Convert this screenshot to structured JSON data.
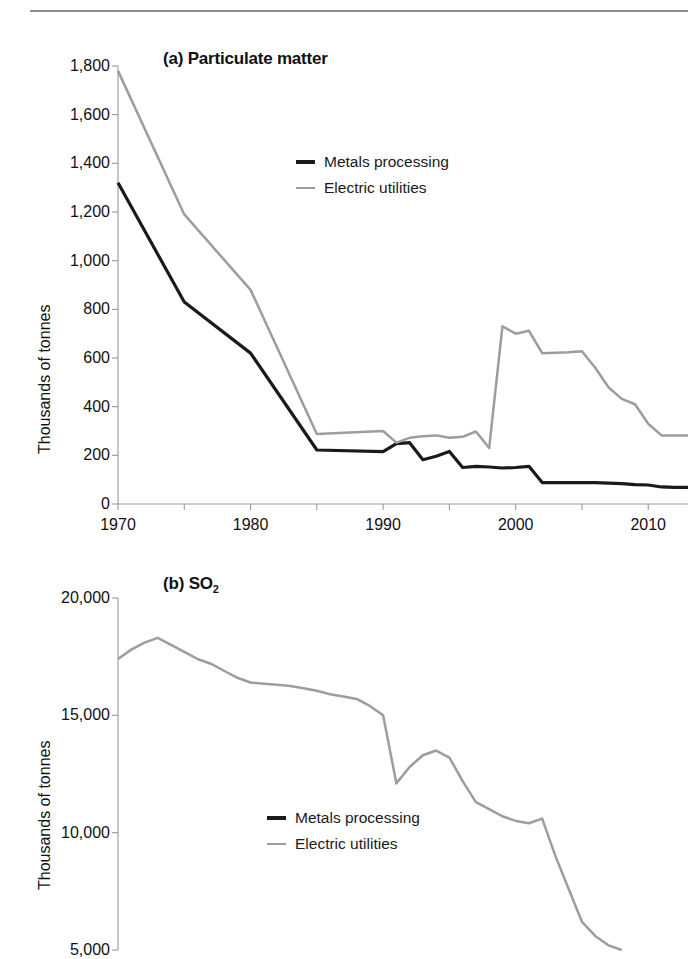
{
  "figure": {
    "ylabel": "Thousands of tonnes",
    "legend": {
      "metals_label": "Metals processing",
      "utilities_label": "Electric utilities"
    },
    "colors": {
      "metals": "#1a1a1a",
      "utilities": "#9d9d9d",
      "axis": "#9a9a9a",
      "rule": "#8c8c8c",
      "text": "#111111",
      "background": "#ffffff"
    }
  },
  "chart_data": [
    {
      "type": "line",
      "panel": "a",
      "title": "(a) Particulate matter",
      "title_prefix": "(a) ",
      "title_main": "Particulate matter",
      "xlabel": "",
      "ylabel": "Thousands of tonnes",
      "xlim": [
        1970,
        2013
      ],
      "ylim": [
        0,
        1800
      ],
      "yticks": [
        0,
        200,
        400,
        600,
        800,
        1000,
        1200,
        1400,
        1600,
        1800
      ],
      "ytick_labels": [
        "0",
        "200",
        "400",
        "600",
        "800",
        "1,000",
        "1,200",
        "1,400",
        "1,600",
        "1,800"
      ],
      "xticks": [
        1970,
        1980,
        1990,
        2000,
        2010
      ],
      "xtick_labels": [
        "1970",
        "1980",
        "1990",
        "2000",
        "2010"
      ],
      "xticks_minor": [
        1975,
        1985,
        1995,
        2005
      ],
      "grid": false,
      "legend_position": "upper-center",
      "x": [
        1970,
        1975,
        1980,
        1985,
        1990,
        1991,
        1992,
        1993,
        1994,
        1995,
        1996,
        1997,
        1998,
        1999,
        2000,
        2001,
        2002,
        2003,
        2004,
        2005,
        2006,
        2007,
        2008,
        2009,
        2010,
        2011,
        2012,
        2013
      ],
      "series": [
        {
          "name": "Metals processing",
          "color": "#1a1a1a",
          "values": [
            1320,
            830,
            620,
            222,
            215,
            248,
            252,
            182,
            196,
            216,
            150,
            155,
            152,
            148,
            150,
            155,
            88,
            88,
            88,
            88,
            88,
            86,
            84,
            80,
            78,
            70,
            68,
            68
          ]
        },
        {
          "name": "Electric utilities",
          "color": "#9d9d9d",
          "values": [
            1780,
            1190,
            880,
            288,
            300,
            252,
            272,
            278,
            282,
            272,
            276,
            298,
            230,
            730,
            700,
            712,
            620,
            622,
            624,
            628,
            560,
            480,
            432,
            410,
            330,
            282,
            282,
            282
          ]
        }
      ]
    },
    {
      "type": "line",
      "panel": "b",
      "title": "(b) SO2",
      "title_prefix": "(b) ",
      "title_main": "SO",
      "title_sub": "2",
      "xlabel": "",
      "ylabel": "Thousands of tonnes",
      "xlim": [
        1970,
        2013
      ],
      "ylim": [
        5000,
        20000
      ],
      "yticks": [
        5000,
        10000,
        15000,
        20000
      ],
      "ytick_labels": [
        "5,000",
        "10,000",
        "15,000",
        "20,000"
      ],
      "xticks": [],
      "xtick_labels": [],
      "grid": false,
      "legend_position": "lower-center",
      "note": "Panel is cropped at the bottom edge of the screenshot",
      "x": [
        1970,
        1971,
        1972,
        1973,
        1974,
        1975,
        1976,
        1977,
        1978,
        1979,
        1980,
        1981,
        1982,
        1983,
        1984,
        1985,
        1986,
        1987,
        1988,
        1989,
        1990,
        1991,
        1992,
        1993,
        1994,
        1995,
        1996,
        1997,
        1998,
        1999,
        2000,
        2001,
        2002,
        2003,
        2004,
        2005,
        2006,
        2007,
        2008
      ],
      "series": [
        {
          "name": "Electric utilities",
          "color": "#9d9d9d",
          "values": [
            17400,
            17800,
            18100,
            18300,
            18000,
            17700,
            17400,
            17200,
            16900,
            16600,
            16400,
            16350,
            16300,
            16250,
            16150,
            16050,
            15900,
            15800,
            15700,
            15400,
            15000,
            12100,
            12800,
            13300,
            13500,
            13200,
            12200,
            11300,
            11000,
            10700,
            10500,
            10400,
            10600,
            9000,
            7600,
            6200,
            5600,
            5200,
            5000
          ]
        },
        {
          "name": "Metals processing",
          "color": "#1a1a1a",
          "values": []
        }
      ]
    }
  ]
}
